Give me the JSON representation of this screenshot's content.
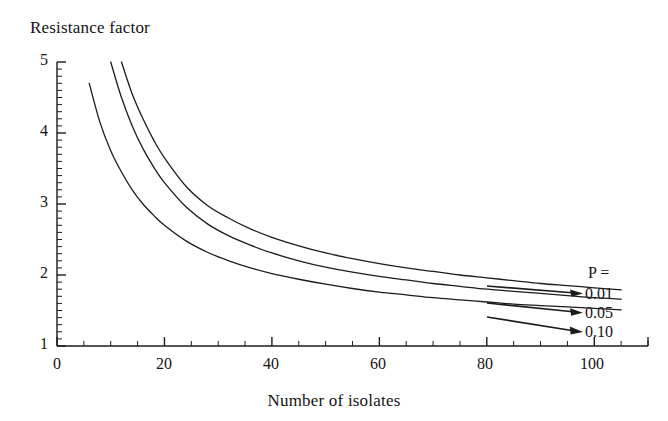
{
  "chart_data": {
    "type": "line",
    "title": "Resistance factor",
    "xlabel": "Number of isolates",
    "ylabel": "Resistance factor",
    "xlim": [
      0,
      110
    ],
    "ylim": [
      1,
      5
    ],
    "grid": false,
    "legend_position": "right-inside",
    "legend_title": "P =",
    "x_major_ticks": [
      0,
      20,
      40,
      60,
      80,
      100
    ],
    "x_tick_labels": [
      "0",
      "20",
      "40",
      "60",
      "80",
      "100"
    ],
    "x_minor_tick_step": 5,
    "y_major_ticks": [
      1,
      2,
      3,
      4,
      5
    ],
    "y_tick_labels": [
      "1",
      "2",
      "3",
      "4",
      "5"
    ],
    "y_minor_tick_step": 0.1,
    "series": [
      {
        "name": "0.01",
        "label": "0.01",
        "color": "#1c1c1c",
        "x": [
          12,
          14,
          16,
          18,
          20,
          24,
          28,
          32,
          36,
          40,
          45,
          50,
          55,
          60,
          65,
          70,
          75,
          80,
          85,
          90,
          95,
          100,
          105
        ],
        "values": [
          5.0,
          4.55,
          4.2,
          3.9,
          3.65,
          3.25,
          2.98,
          2.8,
          2.65,
          2.53,
          2.41,
          2.31,
          2.23,
          2.16,
          2.1,
          2.05,
          2.0,
          1.96,
          1.92,
          1.88,
          1.85,
          1.82,
          1.79
        ]
      },
      {
        "name": "0.05",
        "label": "0.05",
        "color": "#1c1c1c",
        "x": [
          10,
          12,
          14,
          16,
          18,
          20,
          24,
          28,
          32,
          36,
          40,
          45,
          50,
          55,
          60,
          65,
          70,
          75,
          80,
          85,
          90,
          95,
          100,
          105
        ],
        "values": [
          5.0,
          4.5,
          4.1,
          3.78,
          3.52,
          3.3,
          2.96,
          2.72,
          2.55,
          2.42,
          2.31,
          2.2,
          2.11,
          2.04,
          1.98,
          1.93,
          1.88,
          1.84,
          1.8,
          1.77,
          1.74,
          1.71,
          1.68,
          1.66
        ]
      },
      {
        "name": "0.10",
        "label": "0.10",
        "color": "#1c1c1c",
        "x": [
          6,
          8,
          10,
          12,
          14,
          16,
          18,
          20,
          24,
          28,
          32,
          36,
          40,
          45,
          50,
          55,
          60,
          65,
          70,
          75,
          80,
          85,
          90,
          95,
          100,
          105
        ],
        "values": [
          4.7,
          4.15,
          3.75,
          3.45,
          3.2,
          3.0,
          2.84,
          2.7,
          2.48,
          2.32,
          2.2,
          2.1,
          2.02,
          1.94,
          1.87,
          1.81,
          1.76,
          1.72,
          1.68,
          1.65,
          1.62,
          1.59,
          1.57,
          1.55,
          1.53,
          1.51
        ]
      }
    ],
    "annotations": [
      {
        "text": "P =",
        "x": 595,
        "y": 278
      },
      {
        "text": "0.01",
        "x": 592,
        "y": 296
      },
      {
        "text": "0.05",
        "x": 592,
        "y": 315
      },
      {
        "text": "0.10",
        "x": 592,
        "y": 334
      }
    ]
  },
  "axes": {
    "title": "Resistance factor",
    "xlabel": "Number of isolates",
    "xticks": [
      "0",
      "20",
      "40",
      "60",
      "80",
      "100"
    ],
    "yticks": [
      "5",
      "4",
      "3",
      "2",
      "1"
    ]
  },
  "legend": {
    "title": "P =",
    "items": [
      "0.01",
      "0.05",
      "0.10"
    ]
  }
}
